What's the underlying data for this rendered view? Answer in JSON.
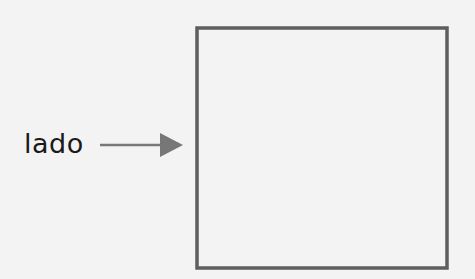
{
  "diagram": {
    "label": "lado",
    "arrow": {
      "from": [
        100,
        145
      ],
      "to": [
        182,
        145
      ],
      "color": "#777777"
    },
    "square": {
      "x": 197,
      "y": 28,
      "width": 250,
      "height": 240,
      "stroke": "#5e5e5e"
    }
  }
}
